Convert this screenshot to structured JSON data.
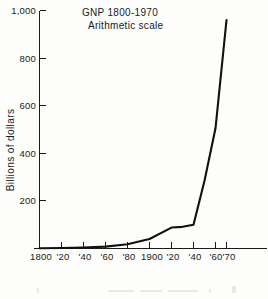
{
  "figure": {
    "title_line1": "GNP 1800-1970",
    "title_line2": "Arithmetic scale",
    "ylabel": "Billions of dollars",
    "ink_color": "#111111",
    "paper_color": "#fdfdfb"
  },
  "chart_data": {
    "type": "line",
    "title": "GNP 1800-1970",
    "subtitle": "Arithmetic scale",
    "xlabel": "",
    "ylabel": "Billions of dollars",
    "xlim": [
      1800,
      1970
    ],
    "ylim": [
      0,
      1000
    ],
    "grid": false,
    "legend": false,
    "y_ticks": [
      0,
      200,
      400,
      600,
      800,
      1000
    ],
    "y_tick_labels": [
      "",
      "200",
      "400",
      "600",
      "800",
      "1,000"
    ],
    "x_ticks": [
      1800,
      1820,
      1840,
      1860,
      1880,
      1900,
      1920,
      1940,
      1960,
      1970
    ],
    "x_tick_labels": [
      "1800",
      "'20",
      "'40",
      "'60",
      "'80",
      "1900",
      "'20",
      "'40",
      "'60",
      "'70"
    ],
    "series": [
      {
        "name": "GNP",
        "units": "Billions of dollars",
        "x": [
          1800,
          1820,
          1840,
          1860,
          1880,
          1900,
          1920,
          1930,
          1940,
          1950,
          1960,
          1970
        ],
        "values": [
          1,
          2,
          4,
          8,
          18,
          40,
          88,
          91,
          100,
          285,
          505,
          960
        ]
      }
    ]
  },
  "artifacts": {
    "note": "faint bleed-through marks along bottom edge"
  }
}
